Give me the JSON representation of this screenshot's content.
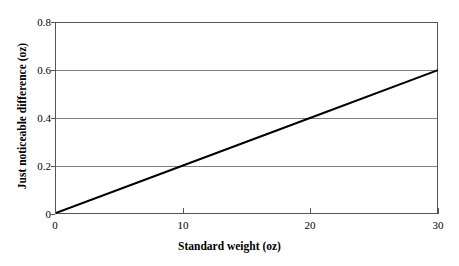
{
  "chart_data": {
    "type": "line",
    "title": "",
    "subtitle": "",
    "xlabel": "Standard weight (oz)",
    "ylabel": "Just noticeable difference (oz)",
    "xlim": [
      0,
      30
    ],
    "ylim": [
      0,
      0.8
    ],
    "xticks": [
      "0",
      "10",
      "20",
      "30"
    ],
    "xtick_values": [
      0,
      10,
      20,
      30
    ],
    "yticks": [
      "0",
      "0.2",
      "0.4",
      "0.6",
      "0.8"
    ],
    "ytick_values": [
      0,
      0.2,
      0.4,
      0.6,
      0.8
    ],
    "grid": "horizontal",
    "legend": "none",
    "annotations": [],
    "series": [
      {
        "name": "Weber's law",
        "x": [
          0,
          10,
          20,
          30
        ],
        "values": [
          0,
          0.2,
          0.4,
          0.6
        ],
        "color": "#000000",
        "line_width": 2,
        "markers": "none"
      }
    ],
    "colors": {
      "line": "#000000",
      "gridline": "#808080",
      "frame": "#555555",
      "text": "#000000",
      "background": "#ffffff"
    }
  }
}
